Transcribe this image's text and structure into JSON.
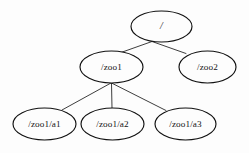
{
  "diagram": {
    "type": "tree",
    "background_color": "#fdfdfd",
    "stroke_color": "#111111",
    "text_color": "#141414",
    "nodes": [
      {
        "id": "root",
        "label": "/",
        "cx": 161.5,
        "cy": 26.5,
        "rx": 30.5,
        "ry": 15.5,
        "level": 0
      },
      {
        "id": "zoo1",
        "label": "/zoo1",
        "cx": 111.5,
        "cy": 67.0,
        "rx": 31.5,
        "ry": 16.0,
        "level": 1
      },
      {
        "id": "zoo2",
        "label": "/zoo2",
        "cx": 207.5,
        "cy": 67.0,
        "rx": 28.5,
        "ry": 16.0,
        "level": 1
      },
      {
        "id": "a1",
        "label": "/zoo1/a1",
        "cx": 44.5,
        "cy": 124.0,
        "rx": 31.5,
        "ry": 16.0,
        "level": 2
      },
      {
        "id": "a2",
        "label": "/zoo1/a2",
        "cx": 112.5,
        "cy": 124.0,
        "rx": 31.5,
        "ry": 16.0,
        "level": 2
      },
      {
        "id": "a3",
        "label": "/zoo1/a3",
        "cx": 185.5,
        "cy": 124.0,
        "rx": 30.5,
        "ry": 16.0,
        "level": 2
      }
    ],
    "edges": [
      {
        "from": "root",
        "to": "zoo1",
        "x1": 152.0,
        "y1": 41.5,
        "x2": 121.0,
        "y2": 52.5
      },
      {
        "from": "root",
        "to": "zoo2",
        "x1": 152.0,
        "y1": 41.5,
        "x2": 186.0,
        "y2": 53.5
      },
      {
        "from": "zoo1",
        "to": "a1",
        "x1": 111.0,
        "y1": 83.0,
        "x2": 62.0,
        "y2": 110.0
      },
      {
        "from": "zoo1",
        "to": "a2",
        "x1": 111.5,
        "y1": 83.0,
        "x2": 112.0,
        "y2": 108.0
      },
      {
        "from": "zoo1",
        "to": "a3",
        "x1": 111.5,
        "y1": 83.0,
        "x2": 166.0,
        "y2": 110.5
      }
    ]
  }
}
